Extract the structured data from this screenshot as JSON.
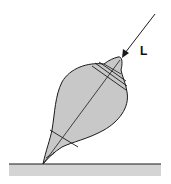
{
  "diagram": {
    "labels": {
      "angular_momentum": "L"
    },
    "colors": {
      "top_fill": "#c8c8c8",
      "ground_fill": "#d4d4d4",
      "stroke": "#1a1a1a",
      "background": "#ffffff"
    }
  }
}
